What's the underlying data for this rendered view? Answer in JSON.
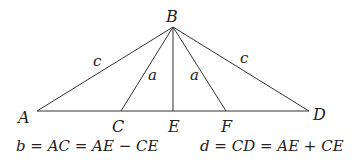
{
  "points": {
    "A": {
      "label": "A",
      "x": 37,
      "y": 111
    },
    "B": {
      "label": "B",
      "x": 173,
      "y": 27
    },
    "C": {
      "label": "C",
      "x": 121,
      "y": 111
    },
    "D": {
      "label": "D",
      "x": 309,
      "y": 111
    },
    "E": {
      "label": "E",
      "x": 173,
      "y": 111
    },
    "F": {
      "label": "F",
      "x": 226,
      "y": 111
    }
  },
  "segments": [
    {
      "from": "A",
      "to": "D"
    },
    {
      "from": "B",
      "to": "A"
    },
    {
      "from": "B",
      "to": "C"
    },
    {
      "from": "B",
      "to": "E"
    },
    {
      "from": "B",
      "to": "F"
    },
    {
      "from": "B",
      "to": "D"
    }
  ],
  "side_labels": {
    "AB": "c",
    "BC": "a",
    "BF": "a",
    "BD": "c"
  },
  "equations": {
    "left": "b = AC = AE − CE",
    "right": "d = CD = AE + CE"
  },
  "colors": {
    "line": "#333333",
    "text": "#222222",
    "background": "#ffffff"
  }
}
